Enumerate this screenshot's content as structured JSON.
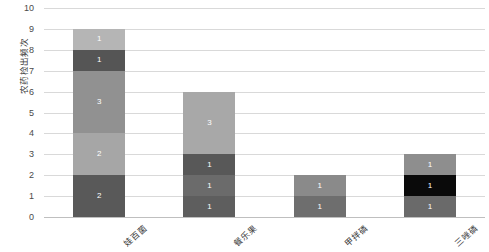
{
  "chart_data": {
    "type": "bar",
    "subtype": "stacked-bar",
    "title": "",
    "xlabel": "",
    "ylabel": "农药检出频次",
    "ylim": [
      0,
      10
    ],
    "ytick_step": 1,
    "yticks": [
      "10",
      "9",
      "8",
      "7",
      "6",
      "5",
      "4",
      "3",
      "2",
      "1",
      "0"
    ],
    "grid": true,
    "grid_axis": "y",
    "legend": false,
    "legend_position": "none",
    "background": "#ffffff",
    "gridline_color": "#d9d9d9",
    "categories": [
      "娃百菌",
      "餐乐果",
      "甲拌磷",
      "三唑磷"
    ],
    "totals": [
      9,
      6,
      2,
      3
    ],
    "bars": [
      {
        "category": "娃百菌",
        "total": 9,
        "segments": [
          {
            "value": 2,
            "label": "2",
            "color": "#595959"
          },
          {
            "value": 2,
            "label": "2",
            "color": "#a6a6a6"
          },
          {
            "value": 3,
            "label": "3",
            "color": "#919191"
          },
          {
            "value": 1,
            "label": "1",
            "color": "#555555"
          },
          {
            "value": 1,
            "label": "1",
            "color": "#b5b5b5"
          }
        ]
      },
      {
        "category": "餐乐果",
        "total": 6,
        "segments": [
          {
            "value": 1,
            "label": "1",
            "color": "#5e5e5e"
          },
          {
            "value": 1,
            "label": "1",
            "color": "#6b6b6b"
          },
          {
            "value": 1,
            "label": "1",
            "color": "#585858"
          },
          {
            "value": 3,
            "label": "3",
            "color": "#a8a8a8"
          }
        ]
      },
      {
        "category": "甲拌磷",
        "total": 2,
        "segments": [
          {
            "value": 1,
            "label": "1",
            "color": "#6e6e6e"
          },
          {
            "value": 1,
            "label": "1",
            "color": "#8a8a8a"
          }
        ]
      },
      {
        "category": "三唑磷",
        "total": 3,
        "segments": [
          {
            "value": 1,
            "label": "1",
            "color": "#6a6a6a"
          },
          {
            "value": 1,
            "label": "1",
            "color": "#0a0a0a"
          },
          {
            "value": 1,
            "label": "1",
            "color": "#8e8e8e"
          }
        ]
      }
    ]
  }
}
